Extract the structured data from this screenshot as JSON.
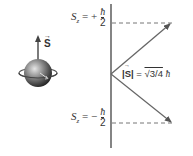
{
  "diagram": {
    "spin_vector_label": "S",
    "upper_state": {
      "symbol": "S",
      "subscript": "z",
      "sign": "= +",
      "numerator": "ħ",
      "denominator": "2"
    },
    "lower_state": {
      "symbol": "S",
      "subscript": "z",
      "sign": "= −",
      "numerator": "ħ",
      "denominator": "2"
    },
    "magnitude_label": {
      "lhs": "|S|",
      "eq": "=",
      "rhs": "√3/4",
      "hbar": "ħ"
    },
    "colors": {
      "axis": "#333333",
      "arrow": "#666666",
      "dashed": "#777777",
      "sphere_light": "#d8d8d8",
      "sphere_dark": "#2a2a2a"
    }
  }
}
